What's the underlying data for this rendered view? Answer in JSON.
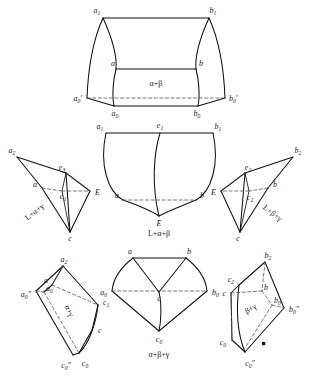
{
  "figure": {
    "background_color": "#ffffff",
    "ink_color": "#111111",
    "dashed_color": "#555555"
  },
  "panels": [
    {
      "id": "top",
      "name": "top-panel",
      "area_label": "α+β",
      "vertices": [
        {
          "key": "a1",
          "base": "a",
          "sub": "1",
          "prime": ""
        },
        {
          "key": "b1",
          "base": "b",
          "sub": "1",
          "prime": ""
        },
        {
          "key": "a",
          "base": "a",
          "sub": "",
          "prime": ""
        },
        {
          "key": "b",
          "base": "b",
          "sub": "",
          "prime": ""
        },
        {
          "key": "a0p",
          "base": "a",
          "sub": "0",
          "prime": "′"
        },
        {
          "key": "b0p",
          "base": "b",
          "sub": "0",
          "prime": "′"
        },
        {
          "key": "a0",
          "base": "a",
          "sub": "0",
          "prime": ""
        },
        {
          "key": "b0",
          "base": "b",
          "sub": "0",
          "prime": ""
        }
      ]
    },
    {
      "id": "mid-center",
      "name": "mid-center-panel",
      "area_label": "L+α+β",
      "vertices": [
        {
          "key": "a1",
          "base": "a",
          "sub": "1",
          "prime": ""
        },
        {
          "key": "e1",
          "base": "e",
          "sub": "1",
          "prime": ""
        },
        {
          "key": "b1",
          "base": "b",
          "sub": "1",
          "prime": ""
        },
        {
          "key": "a",
          "base": "a",
          "sub": "",
          "prime": ""
        },
        {
          "key": "b",
          "base": "b",
          "sub": "",
          "prime": ""
        },
        {
          "key": "E",
          "base": "E",
          "sub": "",
          "prime": ""
        }
      ]
    },
    {
      "id": "mid-left",
      "name": "mid-left-panel",
      "area_label": "L+α+γ",
      "vertices": [
        {
          "key": "a2",
          "base": "a",
          "sub": "2",
          "prime": ""
        },
        {
          "key": "e3",
          "base": "e",
          "sub": "3",
          "prime": ""
        },
        {
          "key": "a",
          "base": "a",
          "sub": "",
          "prime": ""
        },
        {
          "key": "c1",
          "base": "c",
          "sub": "1",
          "prime": ""
        },
        {
          "key": "E",
          "base": "E",
          "sub": "",
          "prime": ""
        },
        {
          "key": "c",
          "base": "c",
          "sub": "",
          "prime": ""
        }
      ]
    },
    {
      "id": "mid-right",
      "name": "mid-right-panel",
      "area_label": "L+β+γ",
      "vertices": [
        {
          "key": "b2",
          "base": "b",
          "sub": "2",
          "prime": ""
        },
        {
          "key": "e2",
          "base": "e",
          "sub": "2",
          "prime": ""
        },
        {
          "key": "E",
          "base": "E",
          "sub": "",
          "prime": ""
        },
        {
          "key": "c2",
          "base": "c",
          "sub": "2",
          "prime": ""
        },
        {
          "key": "b",
          "base": "b",
          "sub": "",
          "prime": ""
        },
        {
          "key": "c",
          "base": "c",
          "sub": "",
          "prime": ""
        }
      ]
    },
    {
      "id": "bottom-left",
      "name": "bottom-left-panel",
      "area_label": "α+γ",
      "vertices": [
        {
          "key": "a2",
          "base": "a",
          "sub": "2",
          "prime": ""
        },
        {
          "key": "a",
          "base": "a",
          "sub": "",
          "prime": ""
        },
        {
          "key": "a0",
          "base": "a",
          "sub": "0",
          "prime": ""
        },
        {
          "key": "a0pp",
          "base": "a",
          "sub": "0",
          "prime": "″"
        },
        {
          "key": "c1",
          "base": "c",
          "sub": "1",
          "prime": ""
        },
        {
          "key": "c",
          "base": "c",
          "sub": "",
          "prime": ""
        },
        {
          "key": "c0",
          "base": "c",
          "sub": "0",
          "prime": ""
        },
        {
          "key": "c0pp",
          "base": "c",
          "sub": "0",
          "prime": "″"
        }
      ]
    },
    {
      "id": "bottom-center",
      "name": "bottom-center-panel",
      "area_label": "α+β+γ",
      "vertices": [
        {
          "key": "a",
          "base": "a",
          "sub": "",
          "prime": ""
        },
        {
          "key": "b",
          "base": "b",
          "sub": "",
          "prime": ""
        },
        {
          "key": "a0",
          "base": "a",
          "sub": "0",
          "prime": ""
        },
        {
          "key": "c",
          "base": "c",
          "sub": "",
          "prime": ""
        },
        {
          "key": "b0",
          "base": "b",
          "sub": "0",
          "prime": ""
        },
        {
          "key": "c0",
          "base": "c",
          "sub": "0",
          "prime": ""
        }
      ]
    },
    {
      "id": "bottom-right",
      "name": "bottom-right-panel",
      "area_label": "β+γ",
      "vertices": [
        {
          "key": "b2",
          "base": "b",
          "sub": "2",
          "prime": ""
        },
        {
          "key": "c2",
          "base": "c",
          "sub": "2",
          "prime": ""
        },
        {
          "key": "b",
          "base": "b",
          "sub": "",
          "prime": ""
        },
        {
          "key": "b0",
          "base": "b",
          "sub": "0",
          "prime": ""
        },
        {
          "key": "b0pp",
          "base": "b",
          "sub": "0",
          "prime": "″"
        },
        {
          "key": "c",
          "base": "c",
          "sub": "",
          "prime": ""
        },
        {
          "key": "c0",
          "base": "c",
          "sub": "0",
          "prime": ""
        },
        {
          "key": "c0pp",
          "base": "c",
          "sub": "0",
          "prime": "″"
        }
      ]
    }
  ]
}
